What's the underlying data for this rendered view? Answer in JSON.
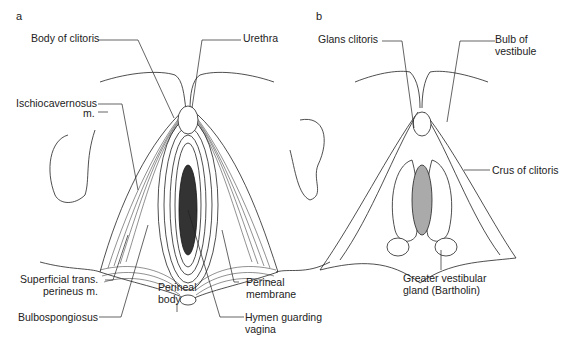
{
  "figure": {
    "panels": [
      {
        "letter": "a",
        "labels": {
          "body_of_clitoris": "Body of clitoris",
          "urethra": "Urethra",
          "ischiocavernosus_1": "Ischiocavernosus",
          "ischiocavernosus_2": "m.",
          "superficial_trans_1": "Superficial trans.",
          "superficial_trans_2": "perineus m.",
          "bulbospongiosus": "Bulbospongiosus",
          "perineal_body_1": "Perineal",
          "perineal_body_2": "body",
          "perineal_membrane_1": "Perineal",
          "perineal_membrane_2": "membrane",
          "hymen_1": "Hymen guarding",
          "hymen_2": "vagina"
        }
      },
      {
        "letter": "b",
        "labels": {
          "glans_clitoris": "Glans clitoris",
          "bulb_1": "Bulb of",
          "bulb_2": "vestibule",
          "crus_of_clitoris": "Crus of clitoris",
          "greater_vestibular_1": "Greater vestibular",
          "greater_vestibular_2": "gland (Bartholin)"
        }
      }
    ]
  }
}
